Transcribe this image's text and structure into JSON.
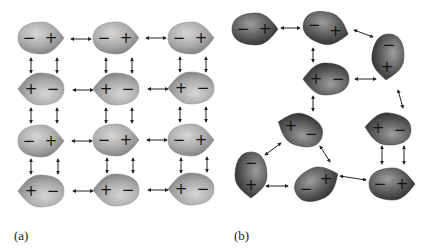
{
  "panels": [
    {
      "label": "(a)",
      "description": "Ordered dipole-dipole arrangement",
      "molecules": [
        {
          "x": 40,
          "y": 38,
          "rot": 0,
          "signs": [
            "−",
            "+"
          ]
        },
        {
          "x": 115,
          "y": 38,
          "rot": 0,
          "signs": [
            "−",
            "+"
          ]
        },
        {
          "x": 190,
          "y": 38,
          "rot": 0,
          "signs": [
            "−",
            "+"
          ]
        },
        {
          "x": 42,
          "y": 89,
          "rot": 180,
          "signs": [
            "−",
            "+"
          ]
        },
        {
          "x": 117,
          "y": 89,
          "rot": 180,
          "signs": [
            "−",
            "+"
          ]
        },
        {
          "x": 192,
          "y": 88,
          "rot": 180,
          "signs": [
            "−",
            "+"
          ]
        },
        {
          "x": 40,
          "y": 141,
          "rot": 0,
          "signs": [
            "−",
            "+"
          ]
        },
        {
          "x": 115,
          "y": 140,
          "rot": 0,
          "signs": [
            "−",
            "+"
          ]
        },
        {
          "x": 190,
          "y": 140,
          "rot": 0,
          "signs": [
            "−",
            "+"
          ]
        },
        {
          "x": 42,
          "y": 191,
          "rot": 180,
          "signs": [
            "−",
            "+"
          ]
        },
        {
          "x": 117,
          "y": 190,
          "rot": 180,
          "signs": [
            "−",
            "+"
          ]
        },
        {
          "x": 192,
          "y": 189,
          "rot": 180,
          "signs": [
            "−",
            "+"
          ]
        }
      ],
      "arrows": [
        {
          "x1": 71,
          "y1": 39,
          "x2": 91,
          "y2": 39
        },
        {
          "x1": 146,
          "y1": 38,
          "x2": 166,
          "y2": 38
        },
        {
          "x1": 73,
          "y1": 90,
          "x2": 93,
          "y2": 90
        },
        {
          "x1": 148,
          "y1": 89,
          "x2": 168,
          "y2": 89
        },
        {
          "x1": 72,
          "y1": 141,
          "x2": 92,
          "y2": 141
        },
        {
          "x1": 147,
          "y1": 140,
          "x2": 167,
          "y2": 140
        },
        {
          "x1": 73,
          "y1": 191,
          "x2": 93,
          "y2": 191
        },
        {
          "x1": 148,
          "y1": 190,
          "x2": 168,
          "y2": 190
        },
        {
          "x1": 31,
          "y1": 58,
          "x2": 31,
          "y2": 73
        },
        {
          "x1": 57,
          "y1": 58,
          "x2": 57,
          "y2": 73
        },
        {
          "x1": 106,
          "y1": 58,
          "x2": 106,
          "y2": 73
        },
        {
          "x1": 132,
          "y1": 58,
          "x2": 132,
          "y2": 73
        },
        {
          "x1": 180,
          "y1": 57,
          "x2": 180,
          "y2": 72
        },
        {
          "x1": 206,
          "y1": 57,
          "x2": 206,
          "y2": 72
        },
        {
          "x1": 31,
          "y1": 108,
          "x2": 31,
          "y2": 123
        },
        {
          "x1": 57,
          "y1": 108,
          "x2": 57,
          "y2": 123
        },
        {
          "x1": 106,
          "y1": 108,
          "x2": 106,
          "y2": 123
        },
        {
          "x1": 132,
          "y1": 108,
          "x2": 132,
          "y2": 123
        },
        {
          "x1": 180,
          "y1": 107,
          "x2": 180,
          "y2": 122
        },
        {
          "x1": 206,
          "y1": 107,
          "x2": 206,
          "y2": 122
        },
        {
          "x1": 31,
          "y1": 159,
          "x2": 31,
          "y2": 174
        },
        {
          "x1": 58,
          "y1": 159,
          "x2": 58,
          "y2": 174
        },
        {
          "x1": 107,
          "y1": 158,
          "x2": 107,
          "y2": 173
        },
        {
          "x1": 133,
          "y1": 158,
          "x2": 133,
          "y2": 173
        },
        {
          "x1": 181,
          "y1": 158,
          "x2": 181,
          "y2": 173
        },
        {
          "x1": 207,
          "y1": 157,
          "x2": 207,
          "y2": 172
        }
      ]
    },
    {
      "label": "(b)",
      "description": "Disordered dipole-dipole arrangement",
      "molecules": [
        {
          "x": 254,
          "y": 29,
          "rot": 0,
          "signs": [
            "−",
            "+"
          ]
        },
        {
          "x": 325,
          "y": 28,
          "rot": 15,
          "signs": [
            "−",
            "+"
          ]
        },
        {
          "x": 388,
          "y": 56,
          "rot": 95,
          "signs": [
            "−",
            "+"
          ]
        },
        {
          "x": 327,
          "y": 79,
          "rot": 180,
          "signs": [
            "−",
            "+"
          ]
        },
        {
          "x": 301,
          "y": 130,
          "rot": 200,
          "signs": [
            "−",
            "+"
          ]
        },
        {
          "x": 389,
          "y": 129,
          "rot": 185,
          "signs": [
            "−",
            "+"
          ]
        },
        {
          "x": 251,
          "y": 174,
          "rot": 90,
          "signs": [
            "−",
            "+"
          ]
        },
        {
          "x": 316,
          "y": 184,
          "rot": -25,
          "signs": [
            "−",
            "+"
          ]
        },
        {
          "x": 391,
          "y": 184,
          "rot": 0,
          "signs": [
            "−",
            "+"
          ]
        }
      ],
      "arrows": [
        {
          "x1": 281,
          "y1": 28,
          "x2": 300,
          "y2": 28
        },
        {
          "x1": 354,
          "y1": 30,
          "x2": 373,
          "y2": 37
        },
        {
          "x1": 313,
          "y1": 48,
          "x2": 313,
          "y2": 62
        },
        {
          "x1": 355,
          "y1": 79,
          "x2": 376,
          "y2": 79
        },
        {
          "x1": 398,
          "y1": 90,
          "x2": 403,
          "y2": 108
        },
        {
          "x1": 313,
          "y1": 96,
          "x2": 313,
          "y2": 111
        },
        {
          "x1": 265,
          "y1": 155,
          "x2": 281,
          "y2": 143
        },
        {
          "x1": 320,
          "y1": 146,
          "x2": 330,
          "y2": 162
        },
        {
          "x1": 266,
          "y1": 186,
          "x2": 288,
          "y2": 186
        },
        {
          "x1": 340,
          "y1": 176,
          "x2": 366,
          "y2": 180
        },
        {
          "x1": 382,
          "y1": 146,
          "x2": 382,
          "y2": 164
        },
        {
          "x1": 404,
          "y1": 146,
          "x2": 404,
          "y2": 164
        }
      ]
    }
  ],
  "colors": {
    "panel_a_fill_light": "#c9c9c9",
    "panel_a_fill_dark": "#8c8c8c",
    "panel_b_fill_light": "#a8a8a8",
    "panel_b_fill_dark": "#4a4a4a",
    "arrow": "#222222",
    "sign": "#111111"
  }
}
